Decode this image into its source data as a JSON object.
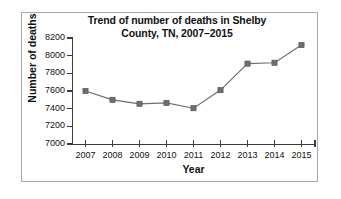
{
  "chart_data": {
    "type": "line",
    "title": "Trend of number of deaths in Shelby County, TN, 2007–2015",
    "title_line1": "Trend of number of deaths in Shelby",
    "title_line2": "County, TN, 2007–2015",
    "xlabel": "Year",
    "ylabel": "Number of deaths",
    "categories": [
      "2007",
      "2008",
      "2009",
      "2010",
      "2011",
      "2012",
      "2013",
      "2014",
      "2015"
    ],
    "values": [
      7600,
      7500,
      7455,
      7465,
      7405,
      7610,
      7910,
      7920,
      8120
    ],
    "ylim": [
      7000,
      8200
    ],
    "ytick_labels": [
      "8200",
      "8000",
      "7800",
      "7600",
      "7400",
      "7200",
      "7000"
    ],
    "ytick_values": [
      8200,
      8000,
      7800,
      7600,
      7400,
      7200,
      7000
    ],
    "grid": false,
    "legend": "none",
    "series": [
      {
        "name": "Number of deaths",
        "marker": "square",
        "color": "#6e6e6e",
        "values": [
          7600,
          7500,
          7455,
          7465,
          7405,
          7610,
          7910,
          7920,
          8120
        ]
      }
    ],
    "colors": {
      "line": "#6e6e6e",
      "marker": "#6e6e6e",
      "axis": "#3c3c3c",
      "frame": "#a8a8a8",
      "text": "#111111",
      "background": "#ffffff"
    }
  }
}
